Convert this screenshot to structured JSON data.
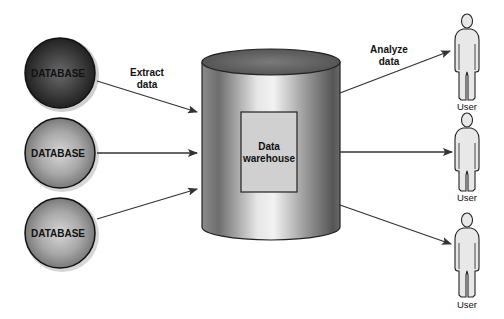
{
  "diagram": {
    "sources": [
      {
        "label": "DATABASE",
        "shade": "dark"
      },
      {
        "label": "DATABASE",
        "shade": "medium"
      },
      {
        "label": "DATABASE",
        "shade": "medium"
      }
    ],
    "extract_label_line1": "Extract",
    "extract_label_line2": "data",
    "warehouse_label_line1": "Data",
    "warehouse_label_line2": "warehouse",
    "analyze_label_line1": "Analyze",
    "analyze_label_line2": "data",
    "users": [
      {
        "label": "User"
      },
      {
        "label": "User"
      },
      {
        "label": "User"
      }
    ]
  }
}
